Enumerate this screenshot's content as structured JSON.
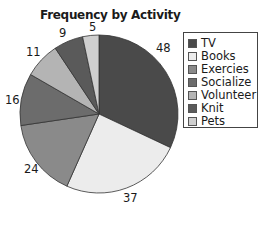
{
  "chart_data": {
    "type": "pie",
    "title": "Frequency by Activity",
    "categories": [
      "TV",
      "Books",
      "Exercies",
      "Socialize",
      "Volunteer",
      "Knit",
      "Pets"
    ],
    "values": [
      48,
      37,
      24,
      16,
      11,
      9,
      5
    ],
    "colors": [
      "#4a4a4a",
      "#ececec",
      "#8a8a8a",
      "#6c6c6c",
      "#b4b4b4",
      "#5a5a5a",
      "#cfcfcf"
    ],
    "start_angle": "12 o'clock",
    "direction": "clockwise",
    "legend_position": "right",
    "data_labels": [
      "48",
      "37",
      "24",
      "16",
      "11",
      "9",
      "5"
    ]
  }
}
